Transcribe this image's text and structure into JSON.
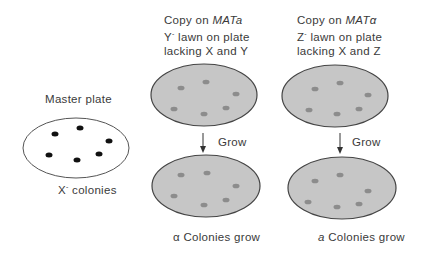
{
  "master": {
    "title": "Master plate",
    "caption_prefix": "X",
    "caption_sup": "-",
    "caption_suffix": " colonies"
  },
  "left_column": {
    "header_line1_prefix": "Copy on ",
    "header_line1_italic": "MATa",
    "header_line2_prefix": "Y",
    "header_line2_sup": "-",
    "header_line2_suffix": " lawn on plate",
    "header_line3": "lacking X and Y",
    "arrow_label": "Grow",
    "result_prefix": "α",
    "result_suffix": " Colonies grow"
  },
  "right_column": {
    "header_line1_prefix": "Copy on ",
    "header_line1_italic": "MATα",
    "header_line2_prefix": "Z",
    "header_line2_sup": "-",
    "header_line2_suffix": " lawn on plate",
    "header_line3": "lacking X and Z",
    "arrow_label": "Grow",
    "result_prefix": "a",
    "result_suffix": " Colonies grow"
  },
  "colors": {
    "plate_fill": "#c6c6c6",
    "plate_stroke": "#444444",
    "colony_gray": "#8c8c8c",
    "colony_black": "#111111",
    "text": "#3a3a3a"
  }
}
